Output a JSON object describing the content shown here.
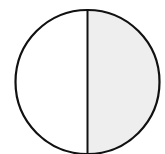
{
  "diagram": {
    "type": "fraction-circle",
    "parts": 2,
    "shaded_parts": 1,
    "shaded_side": "right",
    "colors": {
      "outline": "#111111",
      "shaded": "#eeeeee",
      "unshaded": "#ffffff"
    }
  }
}
